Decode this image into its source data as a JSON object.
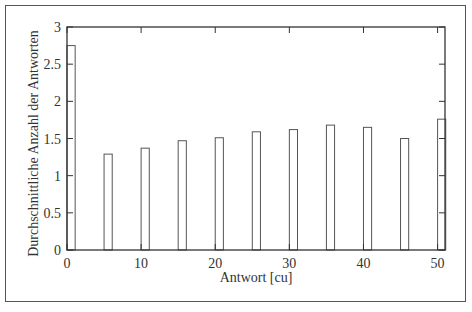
{
  "chart_data": {
    "type": "bar",
    "title": "",
    "xlabel": "Antwort [cu]",
    "ylabel": "Durchschnittliche Anzahl der Antworten",
    "x": [
      0,
      5,
      10,
      15,
      20,
      25,
      30,
      35,
      40,
      45,
      50
    ],
    "values": [
      2.75,
      1.29,
      1.37,
      1.47,
      1.51,
      1.59,
      1.62,
      1.68,
      1.65,
      1.5,
      1.76
    ],
    "xlim": [
      0,
      51
    ],
    "ylim": [
      0,
      3
    ],
    "xticks": [
      "0",
      "10",
      "20",
      "30",
      "40",
      "50"
    ],
    "yticks": [
      "0",
      "0.5",
      "1",
      "1.5",
      "2",
      "2.5",
      "3"
    ],
    "grid": false,
    "legend": null,
    "bar_style": "unfilled outline"
  },
  "colors": {
    "axis": "#333333",
    "bar_outline": "#555555",
    "frame": "#555555",
    "background": "#ffffff"
  }
}
